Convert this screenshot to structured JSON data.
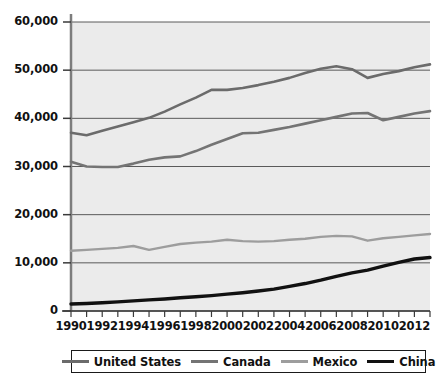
{
  "chart_data": {
    "type": "line",
    "title": "",
    "xlabel": "",
    "ylabel": "",
    "xlim": [
      1990,
      2013
    ],
    "ylim": [
      0,
      60000
    ],
    "grid": true,
    "legend_position": "bottom",
    "x": [
      1990,
      1991,
      1992,
      1993,
      1994,
      1995,
      1996,
      1997,
      1998,
      1999,
      2000,
      2001,
      2002,
      2003,
      2004,
      2005,
      2006,
      2007,
      2008,
      2009,
      2010,
      2011,
      2012,
      2013
    ],
    "series": [
      {
        "name": "United States",
        "color": "#6b6b6b",
        "values": [
          37000,
          36500,
          37400,
          38300,
          39200,
          40100,
          41400,
          42900,
          44300,
          45900,
          45900,
          46300,
          46900,
          47600,
          48400,
          49400,
          50300,
          50800,
          50200,
          48400,
          49200,
          49800,
          50600,
          51200
        ]
      },
      {
        "name": "Canada",
        "color": "#747474",
        "values": [
          31000,
          30000,
          29900,
          29900,
          30600,
          31400,
          31900,
          32100,
          33200,
          34500,
          35700,
          36900,
          37000,
          37600,
          38200,
          38900,
          39600,
          40300,
          41000,
          41100,
          39600,
          40300,
          41000,
          41500
        ]
      },
      {
        "name": "Mexico",
        "color": "#9d9d9d",
        "values": [
          12500,
          12700,
          12900,
          13100,
          13500,
          12700,
          13300,
          13900,
          14200,
          14400,
          14800,
          14500,
          14400,
          14500,
          14800,
          15000,
          15400,
          15600,
          15500,
          14600,
          15100,
          15400,
          15700,
          16000
        ]
      },
      {
        "name": "China",
        "color": "#111111",
        "values": [
          1450,
          1550,
          1700,
          1900,
          2100,
          2300,
          2500,
          2750,
          2950,
          3200,
          3500,
          3800,
          4150,
          4550,
          5100,
          5700,
          6400,
          7200,
          7900,
          8500,
          9300,
          10100,
          10800,
          11100
        ]
      }
    ],
    "y_ticks": [
      0,
      10000,
      20000,
      30000,
      40000,
      50000,
      60000
    ],
    "y_tick_labels": [
      "0",
      "10,000",
      "20,000",
      "30,000",
      "40,000",
      "50,000",
      "60,000"
    ],
    "x_ticks": [
      1990,
      1991,
      1992,
      1993,
      1994,
      1995,
      1996,
      1997,
      1998,
      1999,
      2000,
      2001,
      2002,
      2003,
      2004,
      2005,
      2006,
      2007,
      2008,
      2009,
      2010,
      2011,
      2012,
      2013
    ],
    "x_tick_labels_shown": [
      "1990",
      "1992",
      "1994",
      "1996",
      "1998",
      "2000",
      "2002",
      "2004",
      "2006",
      "2008",
      "2010",
      "2012"
    ],
    "plot_background": "#ebebeb",
    "gridline_color": "#5a5a5a",
    "axis_color": "#6e6e6e"
  },
  "legend": {
    "items": [
      {
        "label": "United States",
        "color": "#6b6b6b",
        "thickness": 3
      },
      {
        "label": "Canada",
        "color": "#747474",
        "thickness": 3
      },
      {
        "label": "Mexico",
        "color": "#9d9d9d",
        "thickness": 2.5
      },
      {
        "label": "China",
        "color": "#111111",
        "thickness": 3.5
      }
    ]
  }
}
